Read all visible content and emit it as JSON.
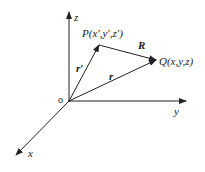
{
  "diagram": {
    "type": "3d-coordinate-vectors",
    "colors": {
      "line": "#222222",
      "background": "#ffffff"
    },
    "axes": {
      "origin_label": "o",
      "x_label": "x",
      "y_label": "y",
      "z_label": "z"
    },
    "points": {
      "P_label": "P(x′,y′,z′)",
      "Q_label": "Q(x,y,z)"
    },
    "vectors": {
      "r_prime_label": "r′",
      "r_label": "r",
      "R_label": "R"
    }
  }
}
